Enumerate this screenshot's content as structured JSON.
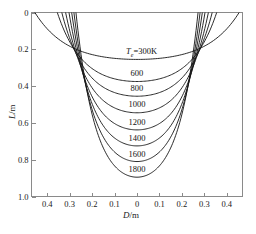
{
  "chart_data": {
    "type": "line",
    "title": "",
    "xlabel": "D/m",
    "ylabel": "L/m",
    "xlim": [
      -0.47,
      0.47
    ],
    "ylim": [
      1.0,
      0.0
    ],
    "y_axis_inverted": true,
    "grid": false,
    "legend": "inline-labels",
    "xticks": [
      -0.4,
      -0.3,
      -0.2,
      -0.1,
      0,
      0.1,
      0.2,
      0.3,
      0.4
    ],
    "xticklabels": [
      "0.4",
      "0.3",
      "0.2",
      "0.1",
      "0",
      "0.1",
      "0.2",
      "0.3",
      "0.4"
    ],
    "yticks": [
      0,
      0.2,
      0.4,
      0.6,
      0.8,
      1.0
    ],
    "yticklabels": [
      "0",
      "0.2",
      "0.4",
      "0.6",
      "0.8",
      "1.0"
    ],
    "series": [
      {
        "name": "Te=300K",
        "label": "300K",
        "label_prefix": "T",
        "label_sub": "e",
        "label_eq": "=",
        "half_width_top": 0.455,
        "depth": 0.255,
        "label_x": 0.02,
        "label_y": 0.215
      },
      {
        "name": "600",
        "label": "600",
        "half_width_top": 0.355,
        "depth": 0.375,
        "label_x": 0.0,
        "label_y": 0.335
      },
      {
        "name": "800",
        "label": "800",
        "half_width_top": 0.335,
        "depth": 0.455,
        "label_x": 0.0,
        "label_y": 0.415
      },
      {
        "name": "1000",
        "label": "1000",
        "half_width_top": 0.318,
        "depth": 0.545,
        "label_x": 0.0,
        "label_y": 0.505
      },
      {
        "name": "1200",
        "label": "1200",
        "half_width_top": 0.303,
        "depth": 0.638,
        "label_x": 0.0,
        "label_y": 0.598
      },
      {
        "name": "1400",
        "label": "1400",
        "half_width_top": 0.291,
        "depth": 0.725,
        "label_x": 0.0,
        "label_y": 0.687
      },
      {
        "name": "1600",
        "label": "1600",
        "half_width_top": 0.281,
        "depth": 0.81,
        "label_x": 0.0,
        "label_y": 0.772
      },
      {
        "name": "1800",
        "label": "1800",
        "half_width_top": 0.272,
        "depth": 0.895,
        "label_x": 0.0,
        "label_y": 0.855
      }
    ],
    "curve_color": "#141414",
    "axis_color": "#8a8a8a"
  },
  "axes": {
    "x_title_italic": "D",
    "x_title_rest": "/m",
    "y_title_italic": "L",
    "y_title_rest": "/m"
  },
  "caption": {
    "text": ""
  }
}
